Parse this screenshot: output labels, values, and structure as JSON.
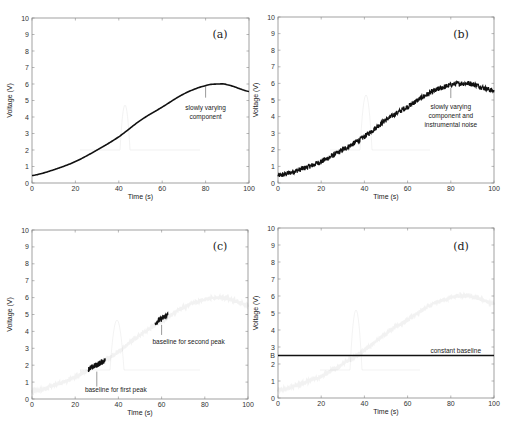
{
  "figure": {
    "panels": [
      {
        "id": "a",
        "label": "(a)",
        "annotation": [
          "slowly varying",
          "component"
        ]
      },
      {
        "id": "b",
        "label": "(b)",
        "annotation": [
          "slowly varying",
          "component and",
          "instrumental noise"
        ]
      },
      {
        "id": "c",
        "label": "(c)",
        "annotation_first": "baseline for first peak",
        "annotation_second": "baseline for second peak"
      },
      {
        "id": "d",
        "label": "(d)",
        "annotation": "constant baseline",
        "baseline_tick": "B"
      }
    ],
    "xlabel": "Time (s)",
    "ylabel": "Voltage (V)",
    "xticks": [
      "0",
      "20",
      "40",
      "60",
      "80",
      "100"
    ],
    "yticks": [
      "0",
      "1",
      "2",
      "3",
      "4",
      "5",
      "6",
      "7",
      "8",
      "9",
      "10"
    ]
  },
  "chart_data": [
    {
      "type": "line",
      "panel": "(a)",
      "title": "",
      "xlabel": "Time (s)",
      "ylabel": "Voltage (V)",
      "xlim": [
        0,
        100
      ],
      "ylim": [
        0,
        10
      ],
      "grid": false,
      "series": [
        {
          "name": "slowly varying component",
          "x": [
            0,
            10,
            20,
            30,
            40,
            50,
            60,
            70,
            80,
            86,
            90,
            100
          ],
          "values": [
            0.45,
            0.8,
            1.3,
            2.0,
            2.8,
            3.8,
            4.6,
            5.4,
            5.9,
            6.0,
            5.95,
            5.55
          ]
        }
      ],
      "annotations": [
        {
          "text": "slowly varying component",
          "x": 80,
          "y": 5.9
        }
      ]
    },
    {
      "type": "line",
      "panel": "(b)",
      "xlabel": "Time (s)",
      "ylabel": "Voltage (V)",
      "xlim": [
        0,
        100
      ],
      "ylim": [
        0,
        10
      ],
      "grid": false,
      "series": [
        {
          "name": "slowly varying component + instrumental noise",
          "x": [
            0,
            10,
            20,
            30,
            40,
            50,
            60,
            70,
            80,
            86,
            90,
            100
          ],
          "values": [
            0.45,
            0.8,
            1.3,
            2.0,
            2.8,
            3.8,
            4.6,
            5.4,
            5.9,
            6.0,
            5.95,
            5.55
          ],
          "noise_amplitude": 0.15
        }
      ],
      "annotations": [
        {
          "text": "slowly varying component and instrumental noise",
          "x": 80,
          "y": 5.9
        }
      ]
    },
    {
      "type": "line",
      "panel": "(c)",
      "xlabel": "Time (s)",
      "ylabel": "Voltage (V)",
      "xlim": [
        0,
        100
      ],
      "ylim": [
        0,
        10
      ],
      "grid": false,
      "series": [
        {
          "name": "baseline for first peak",
          "x": [
            26,
            34
          ],
          "values": [
            1.75,
            2.3
          ]
        },
        {
          "name": "baseline for second peak",
          "x": [
            57,
            63
          ],
          "values": [
            4.5,
            5.0
          ]
        }
      ],
      "annotations": [
        {
          "text": "baseline for first peak",
          "x": 30,
          "y": 2.0
        },
        {
          "text": "baseline for second peak",
          "x": 60,
          "y": 4.7
        }
      ]
    },
    {
      "type": "line",
      "panel": "(d)",
      "xlabel": "Time (s)",
      "ylabel": "Voltage (V)",
      "xlim": [
        0,
        100
      ],
      "ylim": [
        0,
        10
      ],
      "grid": false,
      "series": [
        {
          "name": "constant baseline",
          "x": [
            0,
            100
          ],
          "values": [
            2.5,
            2.5
          ]
        }
      ],
      "annotations": [
        {
          "text": "constant baseline",
          "x": 85,
          "y": 2.5
        },
        {
          "text": "B",
          "x": 0,
          "y": 2.5
        }
      ]
    }
  ]
}
